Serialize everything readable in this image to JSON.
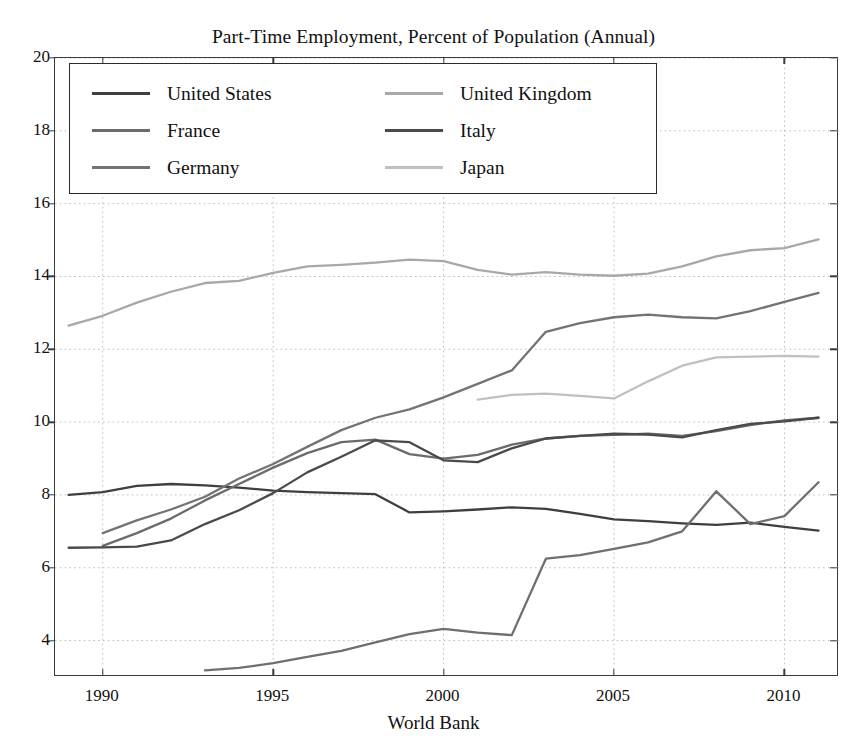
{
  "chart_data": {
    "type": "line",
    "title": "Part-Time Employment, Percent of Population (Annual)",
    "xlabel": "World Bank",
    "ylabel": "",
    "xlim": [
      1988.6,
      2011.6
    ],
    "ylim": [
      3.0,
      20.0
    ],
    "xticks": [
      1990,
      1995,
      2000,
      2005,
      2010
    ],
    "yticks": [
      4,
      6,
      8,
      10,
      12,
      14,
      16,
      18,
      20
    ],
    "xtick_labels": [
      "1990",
      "1995",
      "2000",
      "2005",
      "2010"
    ],
    "ytick_labels": [
      "4",
      "6",
      "8",
      "10",
      "12",
      "14",
      "16",
      "18",
      "20"
    ],
    "grid": true,
    "grid_style": "dotted",
    "legend_position": "upper left",
    "legend_columns": 2,
    "series": [
      {
        "name": "United States",
        "color": "#3f3f3f",
        "x": [
          1989,
          1990,
          1991,
          1992,
          1993,
          1994,
          1995,
          1996,
          1997,
          1998,
          1999,
          2000,
          2001,
          2002,
          2003,
          2004,
          2005,
          2006,
          2007,
          2008,
          2009,
          2010,
          2011
        ],
        "values": [
          8.0,
          8.08,
          8.25,
          8.3,
          8.26,
          8.2,
          8.12,
          8.08,
          8.05,
          8.02,
          7.52,
          7.55,
          7.6,
          7.66,
          7.62,
          7.48,
          7.33,
          7.28,
          7.22,
          7.18,
          7.24,
          7.12,
          7.02
        ]
      },
      {
        "name": "France",
        "color": "#6b6b6b",
        "x": [
          1990,
          1991,
          1992,
          1993,
          1994,
          1995,
          1996,
          1997,
          1998,
          1999,
          2000,
          2001,
          2002,
          2003,
          2004,
          2005,
          2006,
          2007,
          2008,
          2009,
          2010,
          2011
        ],
        "values": [
          6.6,
          6.95,
          7.35,
          7.85,
          8.3,
          8.75,
          9.15,
          9.45,
          9.52,
          9.12,
          9.0,
          9.1,
          9.38,
          9.55,
          9.62,
          9.65,
          9.68,
          9.62,
          9.75,
          9.92,
          10.05,
          10.12
        ]
      },
      {
        "name": "Germany",
        "color": "#737373",
        "x": [
          1990,
          1991,
          1992,
          1993,
          1994,
          1995,
          1996,
          1997,
          1998,
          1999,
          2000,
          2001,
          2002,
          2003,
          2004,
          2005,
          2006,
          2007,
          2008,
          2009,
          2010,
          2011
        ],
        "values": [
          6.95,
          7.3,
          7.6,
          7.95,
          8.45,
          8.85,
          9.32,
          9.78,
          10.12,
          10.35,
          10.68,
          11.05,
          11.42,
          12.48,
          12.72,
          12.88,
          12.95,
          12.88,
          12.85,
          13.05,
          13.3,
          13.55
        ]
      },
      {
        "name": "United Kingdom",
        "color": "#a8a8a8",
        "x": [
          1989,
          1990,
          1991,
          1992,
          1993,
          1994,
          1995,
          1996,
          1997,
          1998,
          1999,
          2000,
          2001,
          2002,
          2003,
          2004,
          2005,
          2006,
          2007,
          2008,
          2009,
          2010,
          2011
        ],
        "values": [
          12.65,
          12.92,
          13.28,
          13.58,
          13.82,
          13.88,
          14.1,
          14.28,
          14.32,
          14.38,
          14.46,
          14.42,
          14.18,
          14.05,
          14.12,
          14.05,
          14.02,
          14.08,
          14.28,
          14.55,
          14.72,
          14.78,
          15.02
        ]
      },
      {
        "name": "Italy",
        "color": "#4a4a4a",
        "x": [
          1989,
          1990,
          1991,
          1992,
          1993,
          1994,
          1995,
          1996,
          1997,
          1998,
          1999,
          2000,
          2001,
          2002,
          2003,
          2004,
          2005,
          2006,
          2007,
          2008,
          2009,
          2010,
          2011
        ],
        "values": [
          6.55,
          6.56,
          6.58,
          6.75,
          7.2,
          7.58,
          8.05,
          8.62,
          9.05,
          9.5,
          9.45,
          8.95,
          8.9,
          9.28,
          9.55,
          9.62,
          9.68,
          9.66,
          9.58,
          9.78,
          9.95,
          10.02,
          10.12
        ]
      },
      {
        "name": "Japan",
        "color": "#c0c0c0",
        "x": [
          2001,
          2002,
          2003,
          2004,
          2005,
          2006,
          2007,
          2008,
          2009,
          2010,
          2011
        ],
        "values": [
          10.62,
          10.75,
          10.78,
          10.72,
          10.65,
          11.12,
          11.55,
          11.78,
          11.8,
          11.82,
          11.8
        ]
      }
    ],
    "extra_series": [
      {
        "name": "Japan Lower",
        "color": "#6f6f6f",
        "x": [
          1993,
          1994,
          1995,
          1996,
          1997,
          1998,
          1999,
          2000,
          2001,
          2002,
          2003,
          2004,
          2005,
          2006,
          2007,
          2008,
          2009,
          2010,
          2011
        ],
        "values": [
          3.18,
          3.25,
          3.38,
          3.55,
          3.72,
          3.95,
          4.18,
          4.32,
          4.22,
          4.15,
          6.25,
          6.35,
          6.52,
          6.7,
          7.0,
          8.1,
          7.2,
          7.42,
          8.35
        ]
      }
    ]
  },
  "legend": {
    "entries": [
      {
        "label": "United States",
        "color": "#3f3f3f"
      },
      {
        "label": "United Kingdom",
        "color": "#a8a8a8"
      },
      {
        "label": "France",
        "color": "#6b6b6b"
      },
      {
        "label": "Italy",
        "color": "#4a4a4a"
      },
      {
        "label": "Germany",
        "color": "#737373"
      },
      {
        "label": "Japan",
        "color": "#c0c0c0"
      }
    ]
  },
  "style": {
    "frame_color": "#3a3a3a",
    "grid_color": "#bdbdbd",
    "background": "#ffffff",
    "text_color": "#111111"
  }
}
